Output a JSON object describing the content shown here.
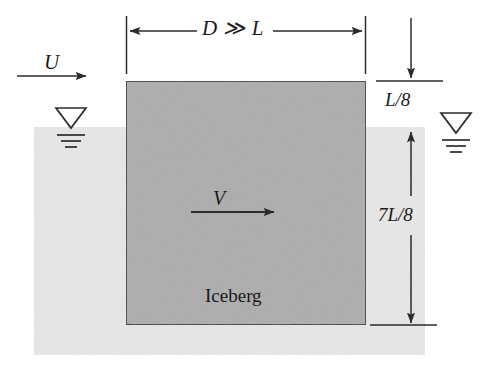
{
  "figure": {
    "labels": {
      "width_dimension": "D ≫ L",
      "freestream_velocity": "U",
      "iceberg_velocity": "V",
      "freeboard_dimension": "L/8",
      "draft_dimension": "7L/8",
      "body_label": "Iceberg"
    },
    "colors": {
      "iceberg_fill": "#adadad",
      "water_fill": "#e8e8e8",
      "line": "#2b2b2b",
      "background": "#ffffff"
    },
    "geometry": {
      "iceberg": {
        "x": 126,
        "y": 81,
        "width": 240,
        "height": 244
      },
      "water": {
        "x": 34,
        "y": 127,
        "width": 391,
        "height": 228
      },
      "waterline_y": 127,
      "iceberg_bottom_y": 325
    },
    "icons": {
      "water_surface_symbol_left": "free-surface-triangle",
      "water_surface_symbol_right": "free-surface-triangle"
    }
  }
}
